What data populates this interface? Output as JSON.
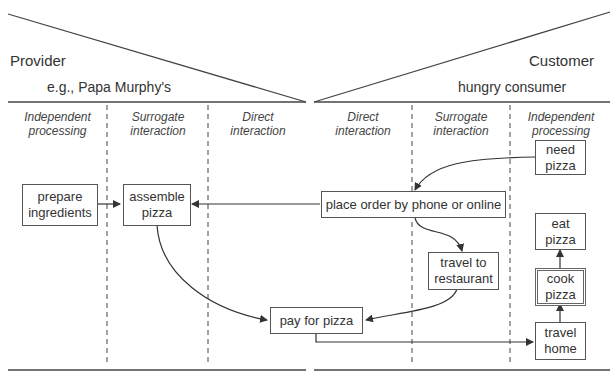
{
  "provider": {
    "title": "Provider",
    "example": "e.g., Papa Murphy's",
    "columns": [
      {
        "line1": "Independent",
        "line2": "processing"
      },
      {
        "line1": "Surrogate",
        "line2": "interaction"
      },
      {
        "line1": "Direct",
        "line2": "interaction"
      }
    ]
  },
  "customer": {
    "title": "Customer",
    "example": "hungry consumer",
    "columns": [
      {
        "line1": "Direct",
        "line2": "interaction"
      },
      {
        "line1": "Surrogate",
        "line2": "interaction"
      },
      {
        "line1": "Independent",
        "line2": "processing"
      }
    ]
  },
  "steps": {
    "prepare": {
      "line1": "prepare",
      "line2": "ingredients"
    },
    "assemble": {
      "line1": "assemble",
      "line2": "pizza"
    },
    "need": {
      "line1": "need",
      "line2": "pizza"
    },
    "order": {
      "line1": "place order by phone or online"
    },
    "travel_to": {
      "line1": "travel to",
      "line2": "restaurant"
    },
    "pay": {
      "line1": "pay for pizza"
    },
    "eat": {
      "line1": "eat",
      "line2": "pizza"
    },
    "cook": {
      "line1": "cook",
      "line2": "pizza"
    },
    "travel_home": {
      "line1": "travel",
      "line2": "home"
    }
  }
}
